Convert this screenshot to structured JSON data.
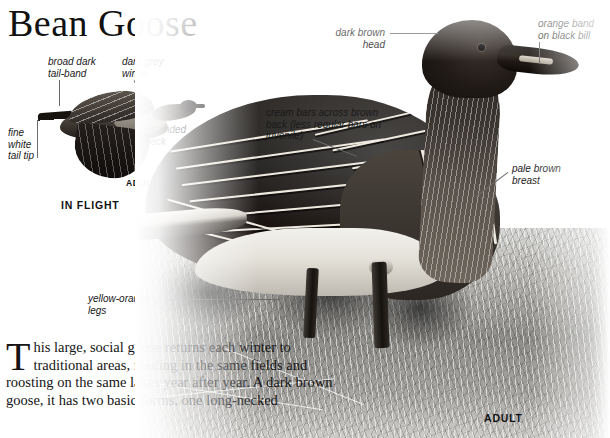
{
  "page": {
    "title": "Bean Goose",
    "species_common_name": "Bean Goose"
  },
  "flight_panel": {
    "caption": "IN FLIGHT",
    "age_tag": "ADULT",
    "callouts": [
      {
        "id": "tail-band",
        "text": "broad dark\ntail-band"
      },
      {
        "id": "grey-wings",
        "text": "dark grey\nwings"
      },
      {
        "id": "white-tip",
        "text": "fine\nwhite\ntail tip"
      },
      {
        "id": "ext-neck",
        "text": "extended\nneck"
      }
    ]
  },
  "main_photo": {
    "age_tag": "ADULT",
    "callouts": [
      {
        "id": "head",
        "text": "dark brown\nhead"
      },
      {
        "id": "bill",
        "text": "orange band\non black bill"
      },
      {
        "id": "back",
        "text": "cream bars across brown\nback (less regular bars on\njuvenile)"
      },
      {
        "id": "breast",
        "text": "pale brown\nbreast"
      },
      {
        "id": "legs",
        "text": "yellow-orange\nlegs"
      }
    ]
  },
  "body_text": {
    "dropcap": "T",
    "text": "his large, social goose returns each winter to traditional areas, feeding in the same fields and roosting on the same lakes year after year. A dark brown goose, it has two basic forms, one long-necked"
  },
  "colors": {
    "page_background": "#ffffff",
    "ink": "#111111",
    "leader_line": "#6b6b6b",
    "plumage_dark": "#17100d",
    "plumage_bar": "#efeae0",
    "ground_mid": "#8f8e8a"
  }
}
